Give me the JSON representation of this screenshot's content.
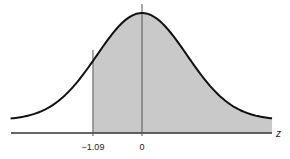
{
  "chart_data": {
    "type": "area",
    "title": "",
    "xlabel": "z",
    "ylabel": "",
    "distribution": "standard normal",
    "xlim": [
      -2.92,
      2.89
    ],
    "shaded_region": {
      "from": -1.09,
      "to": 2.89
    },
    "markers": [
      {
        "x": -1.09,
        "label": "−1.09"
      },
      {
        "x": 0,
        "label": "0"
      }
    ],
    "grid": false,
    "legend": null
  },
  "colors": {
    "curve": "#111111",
    "shade": "#c9c9c9",
    "axis": "#333333",
    "marker_line": "#555555"
  },
  "labels": {
    "axis_z": "z",
    "tick_neg_109": "−1.09",
    "tick_zero": "0"
  }
}
